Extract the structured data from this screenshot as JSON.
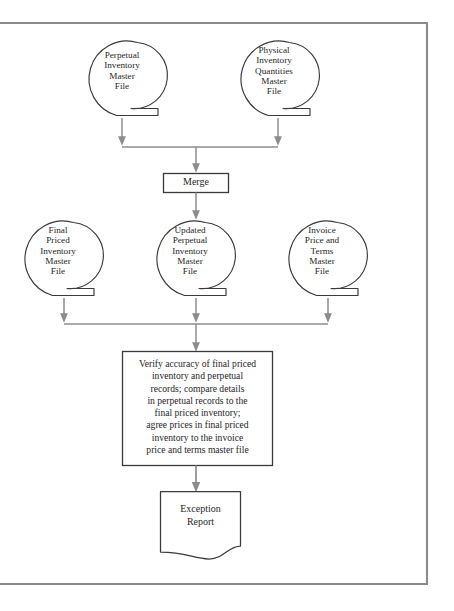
{
  "diagram": {
    "frame": {
      "border_color": "#8a8a8a",
      "border_width_px": 2,
      "open_side": "left"
    },
    "style": {
      "shape_stroke": "#3a3a3a",
      "connector_stroke": "#8c8c8c",
      "fill": "#ffffff",
      "text_color": "#262626"
    },
    "nodes": [
      {
        "id": "perpetual-inventory-master-file",
        "type": "magnetic-tape",
        "label": "Perpetual\nInventory\nMaster\nFile",
        "row": "inputs"
      },
      {
        "id": "physical-inventory-quantities-master-file",
        "type": "magnetic-tape",
        "label": "Physical\nInventory\nQuantities\nMaster\nFile",
        "row": "inputs"
      },
      {
        "id": "merge",
        "type": "process-box",
        "label": "Merge",
        "row": "merge"
      },
      {
        "id": "final-priced-inventory-master-file",
        "type": "magnetic-tape",
        "label": "Final\nPriced\nInventory\nMaster\nFile",
        "row": "middle-files"
      },
      {
        "id": "updated-perpetual-inventory-master-file",
        "type": "magnetic-tape",
        "label": "Updated\nPerpetual\nInventory\nMaster\nFile",
        "row": "middle-files"
      },
      {
        "id": "invoice-price-and-terms-master-file",
        "type": "magnetic-tape",
        "label": "Invoice\nPrice and\nTerms\nMaster\nFile",
        "row": "middle-files"
      },
      {
        "id": "verify-accuracy-process",
        "type": "process-box",
        "label": "Verify accuracy of final priced\ninventory and perpetual\nrecords; compare details\nin perpetual records to the\nfinal priced inventory;\nagree prices in final priced\ninventory to the invoice\nprice and terms master file",
        "row": "process"
      },
      {
        "id": "exception-report",
        "type": "document",
        "label": "Exception\nReport",
        "row": "output"
      }
    ],
    "connectors": [
      {
        "from": "perpetual-inventory-master-file",
        "to": "merge-junction",
        "kind": "arrow-down"
      },
      {
        "from": "physical-inventory-quantities-master-file",
        "to": "merge-junction",
        "kind": "arrow-down"
      },
      {
        "from": "merge-junction",
        "to": "merge",
        "kind": "arrow-down"
      },
      {
        "from": "merge",
        "to": "updated-perpetual-inventory-master-file",
        "kind": "arrow-down"
      },
      {
        "from": "final-priced-inventory-master-file",
        "to": "verify-junction",
        "kind": "arrow-down"
      },
      {
        "from": "updated-perpetual-inventory-master-file",
        "to": "verify-junction",
        "kind": "arrow-down"
      },
      {
        "from": "invoice-price-and-terms-master-file",
        "to": "verify-junction",
        "kind": "arrow-down"
      },
      {
        "from": "verify-junction",
        "to": "verify-accuracy-process",
        "kind": "arrow-down"
      },
      {
        "from": "verify-accuracy-process",
        "to": "exception-report",
        "kind": "arrow-down"
      }
    ]
  }
}
